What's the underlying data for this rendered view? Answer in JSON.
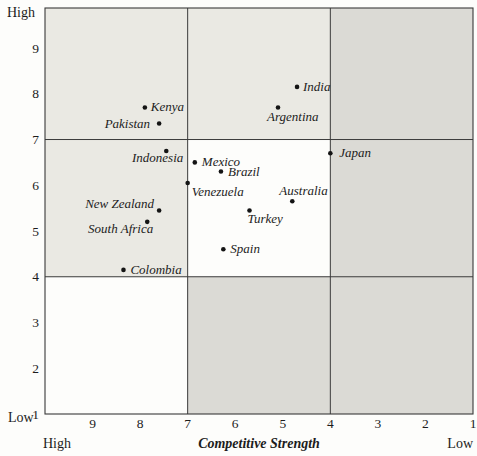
{
  "figure": {
    "width": 477,
    "height": 456
  },
  "colors": {
    "background": "#fdfdfb",
    "cell_light": "#eae9e3",
    "cell_white": "#fdfdfb",
    "cell_dark": "#dbdad5",
    "line": "#3a3a3a",
    "text": "#1c1c1c",
    "dot": "#141414"
  },
  "chart_data": {
    "type": "scatter",
    "title": "",
    "xlabel": "Competitive Strength",
    "ylabel": "",
    "x_axis": {
      "label": "Competitive Strength",
      "ticks": [
        9,
        8,
        7,
        6,
        5,
        4,
        3,
        2,
        1
      ],
      "left_value": 10,
      "right_value": 1,
      "left_end_label": "High",
      "right_end_label": "Low"
    },
    "y_axis": {
      "ticks": [
        9,
        8,
        7,
        6,
        5,
        4,
        3,
        2,
        1
      ],
      "bottom_value": 1,
      "top_value": 9.875,
      "top_end_label": "High",
      "bottom_end_label": "Low"
    },
    "grid": {
      "x_boundaries": [
        7,
        4
      ],
      "y_boundaries": [
        7,
        4
      ]
    },
    "zone_fills": [
      [
        "light",
        "light",
        "dark"
      ],
      [
        "light",
        "white",
        "dark"
      ],
      [
        "white",
        "dark",
        "dark"
      ]
    ],
    "points": [
      {
        "name": "Kenya",
        "x": 7.9,
        "y": 7.7,
        "label_anchor": "start",
        "label_dx": 6,
        "label_dy": 4
      },
      {
        "name": "Pakistan",
        "x": 7.6,
        "y": 7.35,
        "label_anchor": "end",
        "label_dx": -9,
        "label_dy": 4
      },
      {
        "name": "Indonesia",
        "x": 7.45,
        "y": 6.75,
        "label_anchor": "end",
        "label_dx": 17,
        "label_dy": 11
      },
      {
        "name": "Mexico",
        "x": 6.85,
        "y": 6.5,
        "label_anchor": "start",
        "label_dx": 7,
        "label_dy": 4
      },
      {
        "name": "Brazil",
        "x": 6.3,
        "y": 6.3,
        "label_anchor": "start",
        "label_dx": 7,
        "label_dy": 4
      },
      {
        "name": "Venezuela",
        "x": 7.0,
        "y": 6.05,
        "label_anchor": "start",
        "label_dx": 4,
        "label_dy": 13
      },
      {
        "name": "New Zealand",
        "x": 7.6,
        "y": 5.45,
        "label_anchor": "end",
        "label_dx": -5,
        "label_dy": -2
      },
      {
        "name": "South Africa",
        "x": 7.85,
        "y": 5.2,
        "label_anchor": "end",
        "label_dx": 6,
        "label_dy": 11
      },
      {
        "name": "Colombia",
        "x": 8.35,
        "y": 4.15,
        "label_anchor": "start",
        "label_dx": 7,
        "label_dy": 4
      },
      {
        "name": "Spain",
        "x": 6.25,
        "y": 4.6,
        "label_anchor": "start",
        "label_dx": 7,
        "label_dy": 4
      },
      {
        "name": "Turkey",
        "x": 5.7,
        "y": 5.45,
        "label_anchor": "start",
        "label_dx": -2,
        "label_dy": 13
      },
      {
        "name": "Australia",
        "x": 4.8,
        "y": 5.65,
        "label_anchor": "start",
        "label_dx": -13,
        "label_dy": -6
      },
      {
        "name": "Japan",
        "x": 4.0,
        "y": 6.7,
        "label_anchor": "start",
        "label_dx": 9,
        "label_dy": 4
      },
      {
        "name": "India",
        "x": 4.7,
        "y": 8.15,
        "label_anchor": "start",
        "label_dx": 6,
        "label_dy": 4
      },
      {
        "name": "Argentina",
        "x": 5.1,
        "y": 7.7,
        "label_anchor": "start",
        "label_dx": -11,
        "label_dy": 14
      }
    ]
  }
}
